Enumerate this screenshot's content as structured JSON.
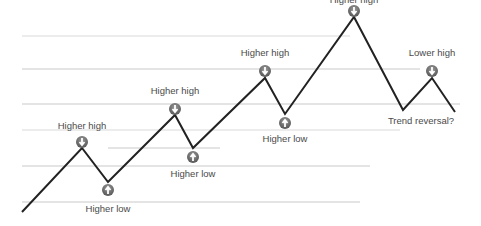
{
  "diagram": {
    "title": "",
    "colors": {
      "background": "#ffffff",
      "trend_line": "#222222",
      "level_line": "#bdbdbd",
      "marker_fill": "#555555",
      "marker_arrow": "#ffffff",
      "label_text": "#4a4a4a"
    },
    "level_lines": [
      {
        "y": 36,
        "x1": 22,
        "x2": 350,
        "opacity": 0.55
      },
      {
        "y": 69,
        "x1": 22,
        "x2": 420,
        "opacity": 0.8
      },
      {
        "y": 104,
        "x1": 22,
        "x2": 460,
        "opacity": 0.8
      },
      {
        "y": 130,
        "x1": 22,
        "x2": 400,
        "opacity": 0.55
      },
      {
        "y": 148,
        "x1": 108,
        "x2": 220,
        "opacity": 0.8
      },
      {
        "y": 166,
        "x1": 22,
        "x2": 370,
        "opacity": 0.8
      },
      {
        "y": 202,
        "x1": 22,
        "x2": 360,
        "opacity": 0.8
      }
    ],
    "trend_path": [
      [
        22,
        212
      ],
      [
        82,
        148
      ],
      [
        108,
        182
      ],
      [
        175,
        115
      ],
      [
        193,
        148
      ],
      [
        265,
        78
      ],
      [
        285,
        114
      ],
      [
        354,
        17
      ],
      [
        403,
        110
      ],
      [
        432,
        78
      ],
      [
        455,
        112
      ]
    ],
    "points": [
      {
        "label": "Higher high",
        "type": "high",
        "x": 82,
        "y": 148,
        "marker_y": 141,
        "label_x": 82,
        "label_y": 121
      },
      {
        "label": "Higher low",
        "type": "low",
        "x": 108,
        "y": 182,
        "marker_y": 189,
        "label_x": 108,
        "label_y": 204
      },
      {
        "label": "Higher high",
        "type": "high",
        "x": 175,
        "y": 115,
        "marker_y": 108,
        "label_x": 175,
        "label_y": 86
      },
      {
        "label": "Higher low",
        "type": "low",
        "x": 193,
        "y": 148,
        "marker_y": 156,
        "label_x": 193,
        "label_y": 169
      },
      {
        "label": "Higher high",
        "type": "high",
        "x": 265,
        "y": 78,
        "marker_y": 70,
        "label_x": 265,
        "label_y": 48
      },
      {
        "label": "Higher low",
        "type": "low",
        "x": 285,
        "y": 114,
        "marker_y": 122,
        "label_x": 285,
        "label_y": 134
      },
      {
        "label": "Higher high",
        "type": "high",
        "x": 354,
        "y": 17,
        "marker_y": 10,
        "label_x": 354,
        "label_y": -5
      },
      {
        "label": "Lower high",
        "type": "high",
        "x": 432,
        "y": 78,
        "marker_y": 70,
        "label_x": 432,
        "label_y": 48
      },
      {
        "label": "Trend reversal?",
        "type": "reversal",
        "x": 403,
        "y": 110,
        "marker_y": null,
        "label_x": 421,
        "label_y": 116
      }
    ]
  }
}
